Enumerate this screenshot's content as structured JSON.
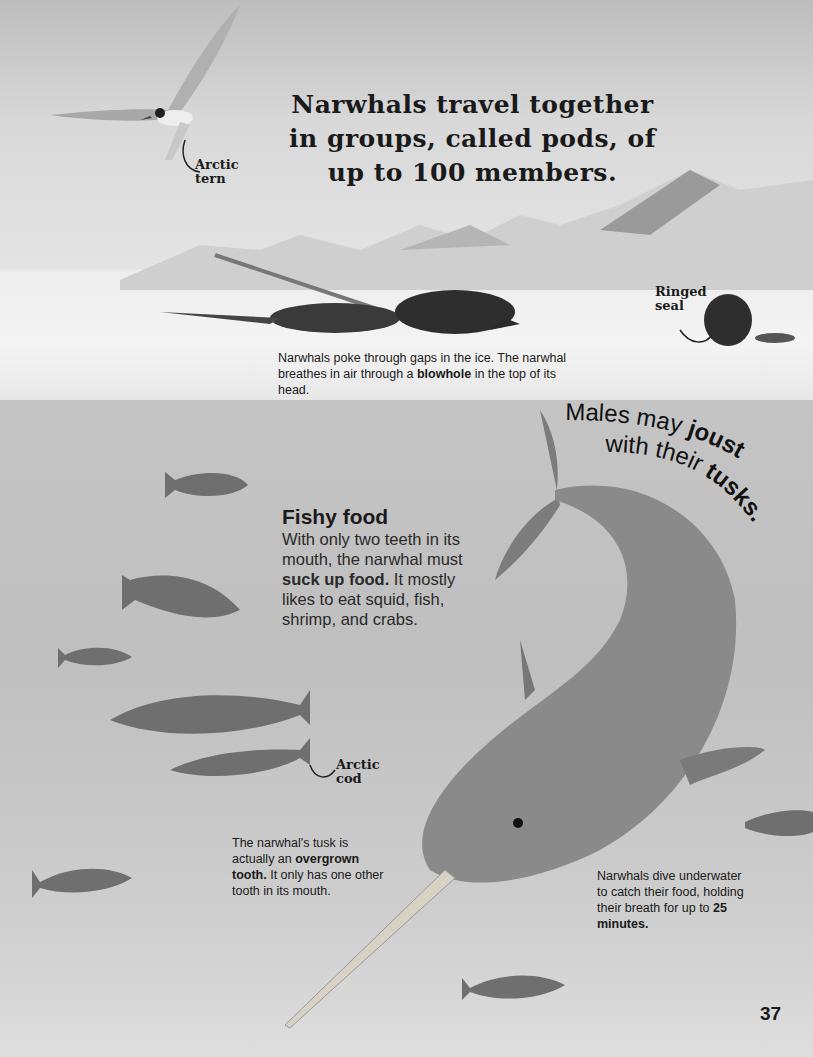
{
  "page": {
    "headline": "Narwhals travel together in groups, called pods, of up to 100 members.",
    "page_number": "37"
  },
  "labels": {
    "tern": [
      "Arctic",
      "tern"
    ],
    "seal": [
      "Ringed",
      "seal"
    ],
    "cod": [
      "Arctic",
      "cod"
    ]
  },
  "captions": {
    "ice": {
      "text_before": "Narwhals poke through gaps in the ice. The narwhal breathes in air through a ",
      "bold": "blowhole",
      "text_after": " in the top of its head."
    },
    "tusk": {
      "text_before": "The narwhal's tusk is actually an ",
      "bold": "overgrown tooth.",
      "text_after": " It only has one other tooth in its mouth."
    },
    "dive": {
      "text_before": "Narwhals dive underwater to catch their food, holding their breath for up to ",
      "bold": "25 minutes.",
      "text_after": ""
    }
  },
  "fishy_food": {
    "heading": "Fishy food",
    "text_before": "With only two teeth in its mouth, the narwhal must ",
    "bold": "suck up food.",
    "text_after": " It mostly likes to eat squid, fish, shrimp, and crabs."
  },
  "joust": {
    "line1_plain": "Males may ",
    "line1_bold": "joust",
    "line2_plain": "with their ",
    "line2_bold": "tusks."
  },
  "illustrations": [
    "arctic-tern",
    "mountains",
    "narwhals-surfacing",
    "ringed-seal",
    "narwhal-diving",
    "arctic-cod-fish"
  ]
}
